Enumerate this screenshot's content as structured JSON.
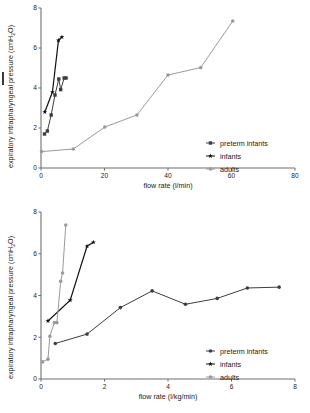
{
  "figures": [
    {
      "id": "flow-rate-absolute",
      "chart_data": {
        "type": "line",
        "title": "",
        "xlabel": "flow rate (l/min)",
        "ylabel": "expiratory intrapharyngeal pressure (cmH2O)",
        "ylabel_main": "expiratory intrapharyngeal pressure (cmH",
        "ylabel_sub": "2",
        "ylabel_tail": "O)",
        "xlim": [
          0,
          80
        ],
        "ylim": [
          0,
          8
        ],
        "xticks": [
          0,
          20,
          40,
          60,
          80
        ],
        "yticks": [
          0,
          2,
          4,
          6,
          8
        ],
        "grid": false,
        "legend_position": "bottom-right",
        "series": [
          {
            "name": "preterm infants",
            "color": "#3d3d3d",
            "marker": "square",
            "points": [
              [
                1.1,
                1.7
              ],
              [
                2.0,
                1.85
              ],
              [
                3.2,
                2.65
              ],
              [
                4.4,
                3.65
              ],
              [
                5.6,
                4.45
              ],
              [
                6.2,
                3.92
              ],
              [
                7.3,
                4.5
              ],
              [
                7.9,
                4.5
              ]
            ]
          },
          {
            "name": "infants",
            "color": "#111111",
            "marker": "star",
            "points": [
              [
                1.2,
                2.8
              ],
              [
                3.6,
                3.8
              ],
              [
                5.5,
                6.38
              ],
              [
                6.6,
                6.55
              ]
            ]
          },
          {
            "name": "adults",
            "color": "#9a9a9a",
            "marker": "dot",
            "points": [
              [
                0.2,
                0.82
              ],
              [
                10.2,
                0.95
              ],
              [
                20.1,
                2.05
              ],
              [
                30.2,
                2.65
              ],
              [
                40.0,
                4.65
              ],
              [
                50.3,
                5.02
              ],
              [
                60.4,
                7.35
              ]
            ]
          }
        ]
      }
    },
    {
      "id": "flow-rate-weight-normalized",
      "chart_data": {
        "type": "line",
        "title": "",
        "xlabel": "flow rate (l/kg/min)",
        "ylabel": "expiratory intrapharyngeal pressure (cmH2O)",
        "ylabel_main": "expiratory intrapharyngeal pressure (cmH",
        "ylabel_sub": "2",
        "ylabel_tail": "O)",
        "xlim": [
          0,
          8
        ],
        "ylim": [
          0,
          8
        ],
        "xticks": [
          0,
          2,
          4,
          6,
          8
        ],
        "yticks": [
          0,
          2,
          4,
          6,
          8
        ],
        "grid": false,
        "legend_position": "bottom-right",
        "series": [
          {
            "name": "preterm infants",
            "color": "#3d3d3d",
            "marker": "dot",
            "points": [
              [
                0.45,
                1.7
              ],
              [
                1.45,
                2.15
              ],
              [
                2.5,
                3.42
              ],
              [
                3.5,
                4.22
              ],
              [
                4.55,
                3.58
              ],
              [
                5.55,
                3.86
              ],
              [
                6.5,
                4.36
              ],
              [
                7.5,
                4.4
              ]
            ]
          },
          {
            "name": "infants",
            "color": "#111111",
            "marker": "star",
            "points": [
              [
                0.22,
                2.78
              ],
              [
                0.92,
                3.78
              ],
              [
                1.45,
                6.36
              ],
              [
                1.65,
                6.55
              ]
            ]
          },
          {
            "name": "adults",
            "color": "#9a9a9a",
            "marker": "dot",
            "points": [
              [
                0.05,
                0.82
              ],
              [
                0.22,
                0.95
              ],
              [
                0.28,
                2.05
              ],
              [
                0.42,
                2.7
              ],
              [
                0.5,
                2.7
              ],
              [
                0.62,
                4.68
              ],
              [
                0.68,
                5.08
              ],
              [
                0.78,
                7.38
              ]
            ]
          }
        ]
      }
    }
  ]
}
